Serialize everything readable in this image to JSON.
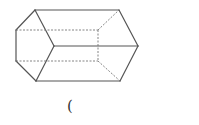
{
  "figure": {
    "type": "hexagonal-prism",
    "stroke_color": "#555555",
    "hidden_stroke_color": "#777777",
    "solid_edges": [
      [
        35,
        10,
        16,
        30
      ],
      [
        16,
        30,
        16,
        61
      ],
      [
        16,
        61,
        36,
        81
      ],
      [
        36,
        81,
        54,
        46
      ],
      [
        54,
        46,
        35,
        10
      ],
      [
        35,
        10,
        119,
        10
      ],
      [
        54,
        46,
        138,
        46
      ],
      [
        36,
        81,
        120,
        81
      ],
      [
        119,
        10,
        138,
        46
      ],
      [
        138,
        46,
        120,
        81
      ]
    ],
    "hidden_edges": [
      [
        16,
        30,
        98,
        30
      ],
      [
        16,
        61,
        98,
        61
      ],
      [
        98,
        30,
        98,
        61
      ],
      [
        98,
        30,
        119,
        10
      ],
      [
        98,
        61,
        120,
        81
      ]
    ]
  },
  "caption": {
    "text": "("
  }
}
